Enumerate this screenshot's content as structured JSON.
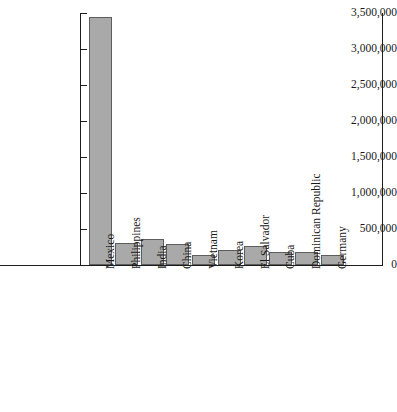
{
  "chart_data": {
    "type": "bar",
    "title": "",
    "xlabel": "",
    "ylabel": "",
    "ylim": [
      0,
      3500000
    ],
    "grid": false,
    "legend": "none",
    "bar_color": "#a9a9a9",
    "bar_border_color": "#5d5d5d",
    "axis_color": "#1d1d1d",
    "categories": [
      "Mexico",
      "Philippines",
      "India",
      "China",
      "Vietnam",
      "Korea",
      "El Salvador",
      "Cuba",
      "Dominican Republic",
      "Germany"
    ],
    "values": [
      3450000,
      300000,
      360000,
      290000,
      145000,
      210000,
      265000,
      175000,
      185000,
      140000
    ],
    "ytick_values": [
      0,
      500000,
      1000000,
      1500000,
      2000000,
      2500000,
      3000000,
      3500000
    ],
    "ytick_labels": [
      "0",
      "500,000",
      "1,000,000",
      "1,500,000",
      "2,000,000",
      "2,500,000",
      "3,000,000",
      "3,500,000"
    ]
  }
}
